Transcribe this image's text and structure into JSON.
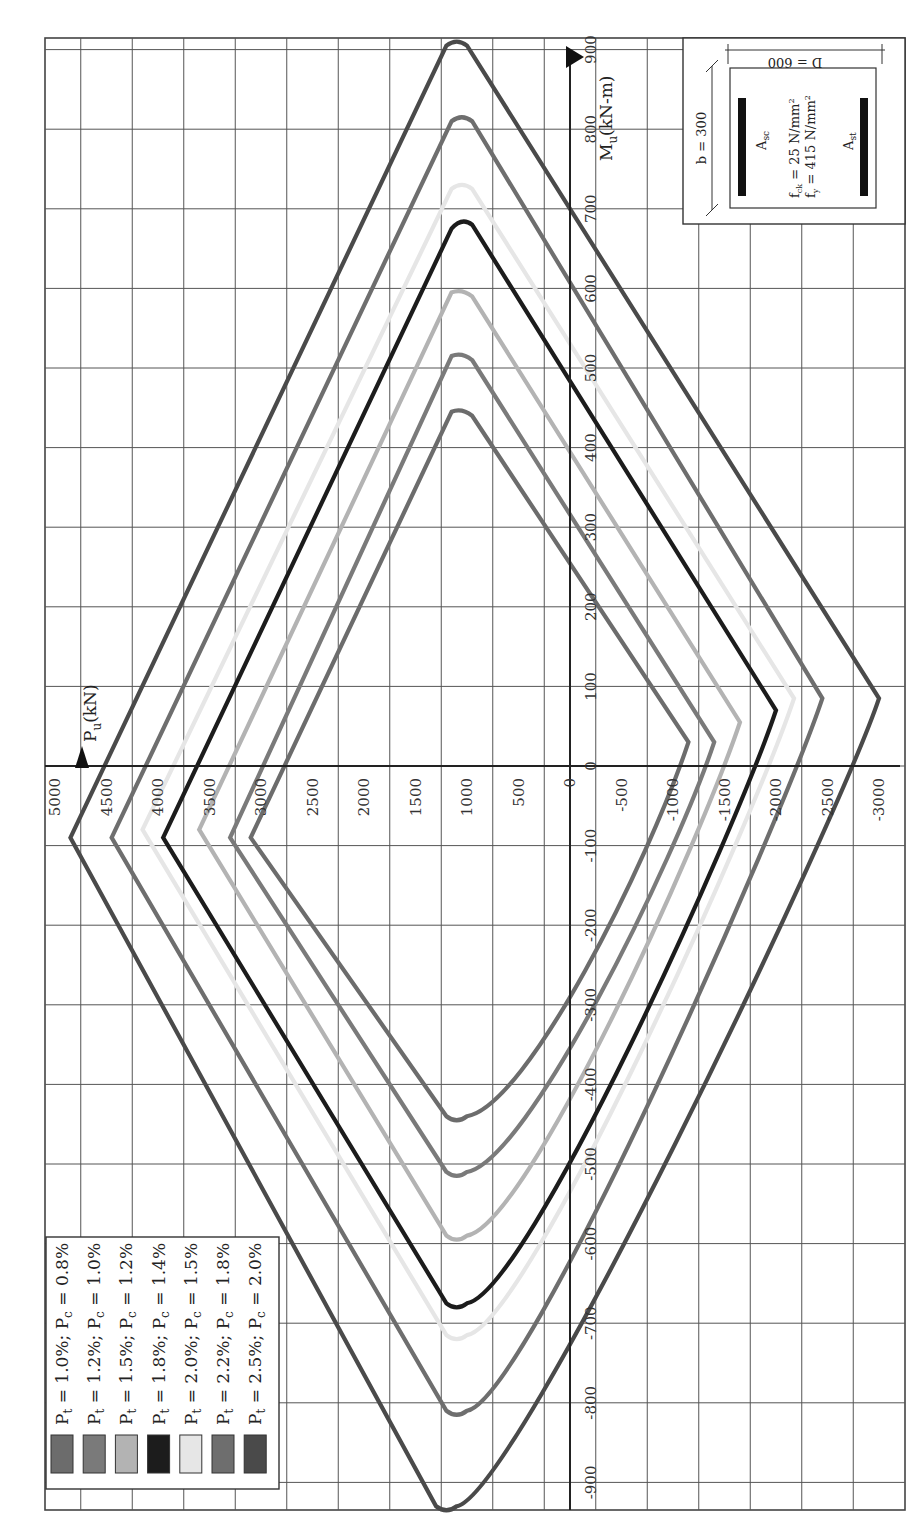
{
  "chart_data": {
    "type": "line",
    "title": "",
    "orientation_note": "figure rotated 90 degrees counter-clockwise on page",
    "xlabel": "M_u(kN-m)",
    "ylabel": "P_u(kN)",
    "xlim": [
      -900,
      900
    ],
    "ylim": [
      -3000,
      5000
    ],
    "grid": true,
    "x_ticks": [
      -900,
      -800,
      -700,
      -600,
      -500,
      -400,
      -300,
      -200,
      -100,
      0,
      100,
      200,
      300,
      400,
      500,
      600,
      700,
      800,
      900
    ],
    "y_ticks": [
      5000,
      4500,
      4000,
      3500,
      3000,
      2500,
      2000,
      1500,
      1000,
      500,
      0,
      -500,
      -1000,
      -1500,
      -2000,
      -2500,
      -3000
    ],
    "y_tick_labels": [
      "5000",
      "4500",
      "4000",
      "3500",
      "3000",
      "2500",
      "2000",
      "1500",
      "1000",
      "500",
      "0",
      "-500",
      "-1000",
      "-1500",
      "-2000",
      "-2500",
      "-3000"
    ],
    "x_tick_labels": [
      "-900",
      "-800",
      "-700",
      "-600",
      "-500",
      "-400",
      "-300",
      "-200",
      "-100",
      "0",
      "100",
      "200",
      "300",
      "400",
      "500",
      "600",
      "700",
      "800",
      "900"
    ],
    "legend_position": "bottom-left",
    "series": [
      {
        "name": "Pt = 1.0%; Pc = 0.8%",
        "color": "#6c6c6c",
        "points": [
          [
            -90,
            3100
          ],
          [
            -440,
            1200
          ],
          [
            -440,
            1000
          ],
          [
            30,
            -1150
          ],
          [
            440,
            950
          ],
          [
            445,
            1150
          ],
          [
            -90,
            3100
          ]
        ]
      },
      {
        "name": "Pt = 1.2%; Pc = 1.0%",
        "color": "#7a7a7a",
        "points": [
          [
            -90,
            3300
          ],
          [
            -510,
            1200
          ],
          [
            -510,
            1000
          ],
          [
            30,
            -1400
          ],
          [
            510,
            950
          ],
          [
            515,
            1150
          ],
          [
            -90,
            3300
          ]
        ]
      },
      {
        "name": "Pt = 1.5%; Pc = 1.2%",
        "color": "#b3b3b3",
        "points": [
          [
            -80,
            3600
          ],
          [
            -590,
            1200
          ],
          [
            -590,
            1000
          ],
          [
            55,
            -1650
          ],
          [
            590,
            950
          ],
          [
            595,
            1150
          ],
          [
            -80,
            3600
          ]
        ]
      },
      {
        "name": "Pt = 1.8%; Pc = 1.4%",
        "color": "#1c1c1c",
        "points": [
          [
            -90,
            3950
          ],
          [
            -675,
            1200
          ],
          [
            -675,
            1000
          ],
          [
            70,
            -2000
          ],
          [
            680,
            950
          ],
          [
            675,
            1150
          ],
          [
            -90,
            3950
          ]
        ]
      },
      {
        "name": "Pt = 2.0%; Pc = 1.5%",
        "color": "#e6e6e6",
        "points": [
          [
            -80,
            4150
          ],
          [
            -715,
            1200
          ],
          [
            -715,
            1000
          ],
          [
            85,
            -2175
          ],
          [
            725,
            950
          ],
          [
            725,
            1150
          ],
          [
            -80,
            4150
          ]
        ]
      },
      {
        "name": "Pt = 2.2%; Pc = 1.8%",
        "color": "#6e6e6e",
        "points": [
          [
            -90,
            4450
          ],
          [
            -810,
            1200
          ],
          [
            -810,
            1000
          ],
          [
            85,
            -2450
          ],
          [
            810,
            950
          ],
          [
            810,
            1150
          ],
          [
            -90,
            4450
          ]
        ]
      },
      {
        "name": "Pt = 2.5%; Pc = 2.0%",
        "color": "#4a4a4a",
        "points": [
          [
            -90,
            4850
          ],
          [
            -930,
            1300
          ],
          [
            -930,
            1100
          ],
          [
            85,
            -3000
          ],
          [
            905,
            1000
          ],
          [
            905,
            1200
          ],
          [
            -90,
            4850
          ]
        ]
      }
    ]
  },
  "axes": {
    "p_axis_label": "P",
    "p_axis_sub": "u",
    "p_axis_unit": "(kN)",
    "m_axis_label": "M",
    "m_axis_sub": "u",
    "m_axis_unit": "(kN-m)"
  },
  "legend": {
    "items": [
      {
        "pt": "1.0%",
        "pc": "0.8%",
        "color": "#6c6c6c"
      },
      {
        "pt": "1.2%",
        "pc": "1.0%",
        "color": "#7a7a7a"
      },
      {
        "pt": "1.5%",
        "pc": "1.2%",
        "color": "#b3b3b3"
      },
      {
        "pt": "1.8%",
        "pc": "1.4%",
        "color": "#1c1c1c"
      },
      {
        "pt": "2.0%",
        "pc": "1.5%",
        "color": "#e6e6e6"
      },
      {
        "pt": "2.2%",
        "pc": "1.8%",
        "color": "#6e6e6e"
      },
      {
        "pt": "2.5%",
        "pc": "2.0%",
        "color": "#4a4a4a"
      }
    ]
  },
  "inset": {
    "b_label": "b = 300",
    "d_label": "D = 600",
    "asc_label": "A",
    "asc_sub": "sc",
    "ast_label": "A",
    "ast_sub": "st",
    "fck_label": "f",
    "fck_sub": "ck",
    "fck_value": " = 25 N/mm",
    "fy_label": "f",
    "fy_sub": "y",
    "fy_value": " = 415 N/mm",
    "sup": "2"
  }
}
